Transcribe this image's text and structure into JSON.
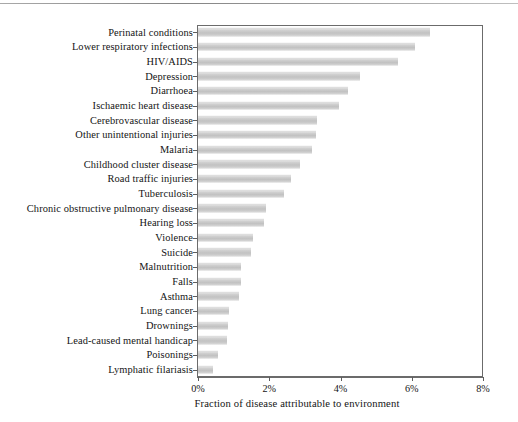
{
  "chart_data": {
    "type": "bar",
    "orientation": "horizontal",
    "title": "",
    "subtitle": "",
    "xlabel": "Fraction of disease attributable to environment",
    "ylabel": "",
    "xlim": [
      0,
      8
    ],
    "xticks": [
      0,
      2,
      4,
      6,
      8
    ],
    "xticklabels": [
      "0%",
      "2%",
      "4%",
      "6%",
      "8%"
    ],
    "grid": false,
    "legend": null,
    "units": "percent",
    "bar_color": "#c8c8c8",
    "frame_color": "#6b6b6b",
    "categories": [
      "Perinatal conditions",
      "Lower respiratory infections",
      "HIV/AIDS",
      "Depression",
      "Diarrhoea",
      "Ischaemic heart disease",
      "Cerebrovascular disease",
      "Other unintentional injuries",
      "Malaria",
      "Childhood cluster disease",
      "Road traffic injuries",
      "Tuberculosis",
      "Chronic obstructive pulmonary disease",
      "Hearing loss",
      "Violence",
      "Suicide",
      "Malnutrition",
      "Falls",
      "Asthma",
      "Lung cancer",
      "Drownings",
      "Lead-caused mental handicap",
      "Poisonings",
      "Lymphatic filariasis"
    ],
    "values": [
      6.5,
      6.1,
      5.6,
      4.55,
      4.2,
      3.95,
      3.35,
      3.3,
      3.2,
      2.85,
      2.6,
      2.4,
      1.9,
      1.85,
      1.55,
      1.5,
      1.2,
      1.2,
      1.15,
      0.87,
      0.85,
      0.8,
      0.57,
      0.43
    ]
  }
}
